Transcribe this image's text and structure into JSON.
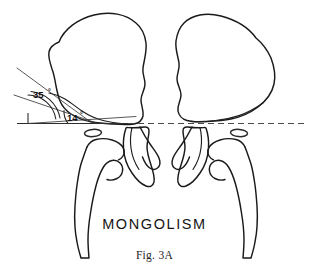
{
  "figure": {
    "title": "MONGOLISM",
    "caption": "Fig. 3A",
    "background_color": "#ffffff",
    "line_color": "#1a1a1a"
  },
  "measurements": {
    "acetabular_index": {
      "label": "35",
      "degree_symbol": "°",
      "full_label": "35°",
      "side": "left"
    },
    "iliac_index": {
      "label": "14",
      "degree_symbol": "°",
      "full_label": "14°",
      "side": "left"
    }
  },
  "reference_lines": {
    "horizontal_baseline": {
      "name": "y-y-horizontal-reference-line",
      "style_left": "solid",
      "style_right": "dashed",
      "color": "#2d2d2d"
    },
    "iliac_ray": {
      "name": "iliac-wing-angle-ray",
      "color": "#3a3a3a"
    },
    "acetabular_ray": {
      "name": "acetabular-roof-angle-ray",
      "color": "#3a3a3a"
    }
  },
  "anatomy": {
    "left_ilium": "left-iliac-wing-outline",
    "right_ilium": "right-iliac-wing-outline",
    "left_femur": "left-proximal-femur-outline",
    "right_femur": "right-proximal-femur-outline",
    "left_ischium": "left-ischium-outline",
    "right_ischium": "right-ischium-outline",
    "left_foramen": "left-obturator-foramen-oval",
    "right_foramen": "right-obturator-foramen-oval"
  }
}
